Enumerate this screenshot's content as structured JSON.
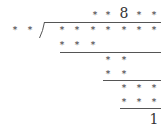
{
  "puzzle": {
    "divisor": [
      "*",
      "*"
    ],
    "quotient": [
      "*",
      "*",
      "8",
      "*",
      "*"
    ],
    "dividend": [
      "*",
      "*",
      "*",
      "*",
      "*",
      "*",
      "*"
    ],
    "steps": [
      [
        "*",
        "*",
        "*"
      ],
      [
        "*",
        "*"
      ],
      [
        "*",
        "*"
      ],
      [
        "*",
        "*",
        "*"
      ],
      [
        "*",
        "*",
        "*"
      ]
    ],
    "remainder": "1"
  }
}
